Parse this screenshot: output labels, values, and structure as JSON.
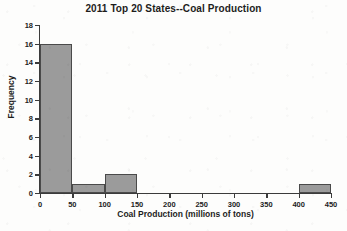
{
  "chart_data": {
    "type": "bar",
    "title": "2011 Top 20 States--Coal Production",
    "xlabel": "Coal Production (millions of tons)",
    "ylabel": "Frequency",
    "xlim": [
      0,
      450
    ],
    "ylim": [
      0,
      18
    ],
    "grid": false,
    "legend": null,
    "bin_width": 50,
    "x_ticks": [
      0,
      50,
      100,
      150,
      200,
      250,
      300,
      350,
      400,
      450
    ],
    "x_tick_labels": [
      "0",
      "50",
      "100",
      "150",
      "200",
      "250",
      "300",
      "350",
      "400",
      "450"
    ],
    "y_ticks": [
      0,
      2,
      4,
      6,
      8,
      10,
      12,
      14,
      16,
      18
    ],
    "y_tick_labels": [
      "0",
      "2",
      "4",
      "6",
      "8",
      "10",
      "12",
      "14",
      "16",
      "18"
    ],
    "bars": [
      {
        "bin_start": 0,
        "bin_end": 50,
        "value": 16
      },
      {
        "bin_start": 50,
        "bin_end": 100,
        "value": 1
      },
      {
        "bin_start": 100,
        "bin_end": 150,
        "value": 2
      },
      {
        "bin_start": 400,
        "bin_end": 450,
        "value": 1
      }
    ],
    "categories": [
      "0-50",
      "50-100",
      "100-150",
      "150-200",
      "200-250",
      "250-300",
      "300-350",
      "350-400",
      "400-450"
    ],
    "values": [
      16,
      1,
      2,
      0,
      0,
      0,
      0,
      0,
      1
    ],
    "colors": {
      "bar_fill": "#9b9b9b",
      "bar_edge": "#4a4a4a",
      "axis": "#3b3b3b",
      "text": "#1d1d1d",
      "background": "#fdfdfc"
    }
  }
}
